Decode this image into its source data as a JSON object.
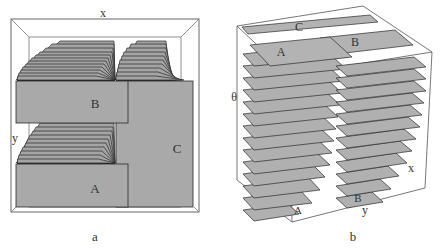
{
  "panels": [
    {
      "id": "a",
      "caption": "a",
      "axes": {
        "x": "x",
        "y": "y"
      },
      "regions": [
        "A",
        "B",
        "C"
      ]
    },
    {
      "id": "b",
      "caption": "b",
      "axes": {
        "theta": "θ",
        "x": "x",
        "y": "y"
      },
      "regions": [
        "A",
        "B",
        "C"
      ]
    }
  ],
  "colors": {
    "fill": "#a9a9a9",
    "stroke": "#2a2a2a",
    "frame": "#555555"
  }
}
